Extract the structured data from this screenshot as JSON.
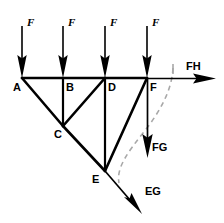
{
  "figure": {
    "type": "truss-free-body-diagram",
    "background_color": "#ffffff",
    "line_color": "#000000",
    "dashed_color": "#9a9a9a"
  },
  "nodes": [
    {
      "id": "A",
      "label": "A",
      "x": 22,
      "y": 78,
      "label_x": 13,
      "label_y": 82
    },
    {
      "id": "B",
      "label": "B",
      "x": 63,
      "y": 78,
      "label_x": 66,
      "label_y": 82
    },
    {
      "id": "C",
      "label": "C",
      "x": 63,
      "y": 126,
      "label_x": 54,
      "label_y": 129
    },
    {
      "id": "D",
      "label": "D",
      "x": 105,
      "y": 78,
      "label_x": 108,
      "label_y": 82
    },
    {
      "id": "E",
      "label": "E",
      "x": 105,
      "y": 171,
      "label_x": 93,
      "label_y": 174
    },
    {
      "id": "F",
      "label": "F",
      "x": 147,
      "y": 78,
      "label_x": 150,
      "label_y": 82
    }
  ],
  "members": [
    {
      "name": "chord-A-F",
      "from": "A",
      "to": "F"
    },
    {
      "name": "diagonal-A-C",
      "from": "A",
      "to": "C"
    },
    {
      "name": "vertical-B-C",
      "from": "B",
      "to": "C"
    },
    {
      "name": "diagonal-C-D",
      "from": "C",
      "to": "D"
    },
    {
      "name": "diagonal-C-E",
      "from": "C",
      "to": "E"
    },
    {
      "name": "vertical-D-E",
      "from": "D",
      "to": "E"
    },
    {
      "name": "diagonal-E-F",
      "from": "E",
      "to": "F"
    }
  ],
  "loads": [
    {
      "name": "load-F-1",
      "label": "F",
      "x": 22,
      "y_start": 26,
      "y_end": 78,
      "label_x": 27,
      "label_y": 20
    },
    {
      "name": "load-F-2",
      "label": "F",
      "x": 63,
      "y_start": 26,
      "y_end": 78,
      "label_x": 68,
      "label_y": 20
    },
    {
      "name": "load-F-3",
      "label": "F",
      "x": 105,
      "y_start": 26,
      "y_end": 78,
      "label_x": 110,
      "label_y": 20
    },
    {
      "name": "load-F-4",
      "label": "F",
      "x": 147,
      "y_start": 26,
      "y_end": 78,
      "label_x": 152,
      "label_y": 20
    }
  ],
  "reactions": [
    {
      "name": "reaction-FH",
      "label": "FH",
      "direction": "right",
      "from_x": 147,
      "from_y": 78,
      "to_x": 216,
      "to_y": 78,
      "label_x": 187,
      "label_y": 62
    },
    {
      "name": "reaction-FG",
      "label": "FG",
      "direction": "down",
      "from_x": 147,
      "from_y": 78,
      "to_x": 147,
      "to_y": 157,
      "label_x": 152,
      "label_y": 143
    },
    {
      "name": "reaction-EG",
      "label": "EG",
      "direction": "down-right",
      "from_x": 105,
      "from_y": 171,
      "to_x": 141,
      "to_y": 213,
      "label_x": 146,
      "label_y": 190
    }
  ],
  "dashed_arc": {
    "name": "deflection-arc",
    "path": "M 173 68 C 172 90, 160 112, 143 133 C 128 152, 116 168, 119 183",
    "tick_x": 173,
    "tick_y_start": 64,
    "tick_y_end": 74
  }
}
